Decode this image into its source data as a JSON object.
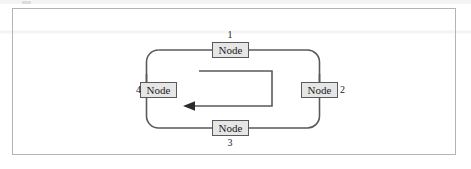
{
  "figure": {
    "kind": "ring-network-diagram",
    "frame": {
      "visible": true,
      "border_color": "#b4b4b4"
    },
    "nodes": [
      {
        "id": "1",
        "label": "Node",
        "number": "1",
        "position": "top"
      },
      {
        "id": "2",
        "label": "Node",
        "number": "2",
        "position": "right"
      },
      {
        "id": "3",
        "label": "Node",
        "number": "3",
        "position": "bottom"
      },
      {
        "id": "4",
        "label": "Node",
        "number": "4",
        "position": "left"
      }
    ],
    "ring": {
      "shape": "rounded-rectangle",
      "stroke_color": "#5a5a5a",
      "stroke_width": 1.6
    },
    "inner_arrow": {
      "description": "counterclockwise flow indicator",
      "direction": "left",
      "stroke_color": "#5a5a5a",
      "stroke_width": 1.6
    },
    "colors": {
      "node_fill": "#e6e6e6",
      "node_border": "#5a5a5a",
      "text": "#1c1c1c",
      "frame_border": "#b4b4b4",
      "page_background": "#ffffff"
    }
  }
}
